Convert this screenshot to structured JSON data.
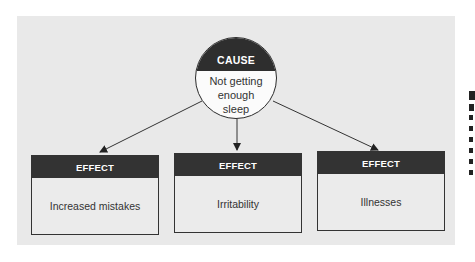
{
  "diagram": {
    "cause": {
      "header": "CAUSE",
      "text_lines": [
        "Not getting",
        "enough",
        "sleep"
      ]
    },
    "effects": [
      {
        "header": "EFFECT",
        "text": "Increased mistakes"
      },
      {
        "header": "EFFECT",
        "text": "Irritability"
      },
      {
        "header": "EFFECT",
        "text": "Illnesses"
      }
    ],
    "colors": {
      "panel_bg": "#e9e9e9",
      "header_bg": "#2e2e2e",
      "header_text": "#ffffff",
      "body_text": "#333333"
    }
  }
}
